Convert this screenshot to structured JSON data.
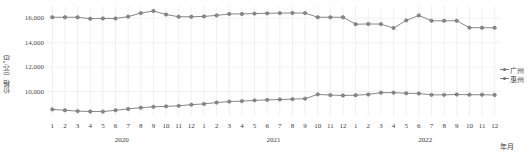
{
  "chart_data": {
    "type": "line",
    "title": "",
    "xlabel": "年月",
    "ylabel": "价格（元/㎡）",
    "ylim": [
      8000,
      17000
    ],
    "yticks": [
      10000,
      12000,
      14000,
      16000
    ],
    "ytick_labels": [
      "10,000",
      "12,000",
      "14,000",
      "16,000"
    ],
    "grid": true,
    "legend_position": "right",
    "years": [
      {
        "label": "2020",
        "months": [
          "1",
          "2",
          "3",
          "4",
          "5",
          "6",
          "7",
          "8",
          "9",
          "10",
          "11",
          "12"
        ]
      },
      {
        "label": "2021",
        "months": [
          "1",
          "2",
          "3",
          "4",
          "5",
          "6",
          "7",
          "8",
          "9",
          "10",
          "11",
          "12"
        ]
      },
      {
        "label": "2022",
        "months": [
          "1",
          "2",
          "3",
          "4",
          "5",
          "6",
          "7",
          "8",
          "9",
          "10",
          "11",
          "12"
        ]
      }
    ],
    "categories": [
      "2020-1",
      "2020-2",
      "2020-3",
      "2020-4",
      "2020-5",
      "2020-6",
      "2020-7",
      "2020-8",
      "2020-9",
      "2020-10",
      "2020-11",
      "2020-12",
      "2021-1",
      "2021-2",
      "2021-3",
      "2021-4",
      "2021-5",
      "2021-6",
      "2021-7",
      "2021-8",
      "2021-9",
      "2021-10",
      "2021-11",
      "2021-12",
      "2022-1",
      "2022-2",
      "2022-3",
      "2022-4",
      "2022-5",
      "2022-6",
      "2022-7",
      "2022-8",
      "2022-9",
      "2022-10",
      "2022-11",
      "2022-12"
    ],
    "series": [
      {
        "name": "广州",
        "color": "#7a7a7a",
        "values": [
          16080,
          16080,
          16080,
          15960,
          15980,
          15980,
          16130,
          16420,
          16590,
          16300,
          16120,
          16120,
          16150,
          16230,
          16350,
          16350,
          16380,
          16400,
          16420,
          16430,
          16420,
          16080,
          16080,
          16080,
          15510,
          15530,
          15520,
          15200,
          15820,
          16230,
          15790,
          15790,
          15790,
          15230,
          15220,
          15220
        ]
      },
      {
        "name": "惠州",
        "color": "#7a7a7a",
        "values": [
          8540,
          8470,
          8400,
          8370,
          8360,
          8470,
          8580,
          8680,
          8750,
          8790,
          8830,
          8930,
          8990,
          9100,
          9180,
          9220,
          9280,
          9320,
          9350,
          9380,
          9420,
          9770,
          9710,
          9680,
          9700,
          9760,
          9910,
          9910,
          9860,
          9840,
          9730,
          9730,
          9760,
          9740,
          9740,
          9720
        ]
      }
    ]
  },
  "legend": {
    "items": [
      {
        "label": "广州"
      },
      {
        "label": "惠州"
      }
    ]
  }
}
